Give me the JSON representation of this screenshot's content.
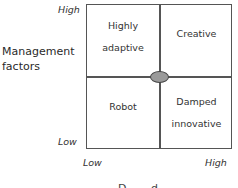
{
  "diagram": {
    "type": "2x2 matrix",
    "y_axis": {
      "label_line1": "Management",
      "label_line2": "factors",
      "high": "High",
      "low": "Low"
    },
    "x_axis": {
      "low": "Low",
      "high": "High",
      "label_partial": "D...  ...d..."
    },
    "quadrants": {
      "top_left": {
        "line1": "Highly",
        "line2": "adaptive"
      },
      "top_right": {
        "line1": "Creative"
      },
      "bottom_left": {
        "line1": "Robot"
      },
      "bottom_right": {
        "line1": "Damped",
        "line2": "innovative"
      }
    },
    "center_marker": {
      "shape": "ellipse",
      "fill": "#9a9a9a",
      "stroke": "#444444"
    },
    "line_color": "#555555"
  }
}
